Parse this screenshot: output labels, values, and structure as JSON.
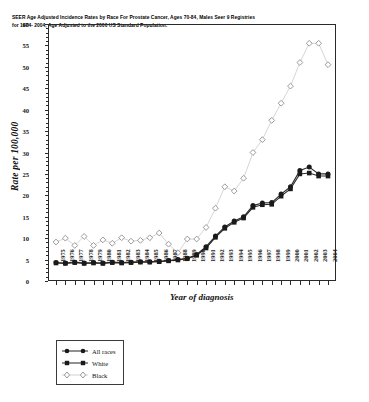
{
  "chart_data": {
    "type": "line",
    "title": "SEER  Age Adjusted Incidence Rates by Race For Prostate Cancer,  Ages 70-84, Males Seer 9 Registries for 1974- 2004, Age Adjusted to the 2000 US Standard Population.",
    "xlabel": "Year of diagnosis",
    "ylabel": "Rate per 100,000",
    "xlim": [
      1975,
      2004
    ],
    "ylim": [
      0,
      60
    ],
    "ytick_step": 5,
    "grid": false,
    "legend_position": "below-left",
    "x": [
      1975,
      1976,
      1977,
      1978,
      1979,
      1980,
      1981,
      1982,
      1983,
      1984,
      1985,
      1986,
      1987,
      1988,
      1989,
      1990,
      1991,
      1992,
      1993,
      1994,
      1995,
      1996,
      1997,
      1998,
      1999,
      2000,
      2001,
      2002,
      2003,
      2004
    ],
    "ytick_labels": [
      "0",
      "5",
      "10",
      "15",
      "20",
      "25",
      "30",
      "35",
      "40",
      "45",
      "50",
      "55",
      "60"
    ],
    "series": [
      {
        "name": "All races",
        "marker": "filled-circle",
        "color": "#1a1a1a",
        "values": [
          4.3,
          4.2,
          4.4,
          4.2,
          4.3,
          4.2,
          4.4,
          4.3,
          4.4,
          4.5,
          4.5,
          4.6,
          4.8,
          5.0,
          5.3,
          6.2,
          8.0,
          10.5,
          12.6,
          14.0,
          15.0,
          17.6,
          18.2,
          18.3,
          20.3,
          22.0,
          25.8,
          26.6,
          25.0,
          25.0
        ]
      },
      {
        "name": "White",
        "marker": "filled-square",
        "color": "#1a1a1a",
        "values": [
          4.2,
          4.1,
          4.3,
          4.1,
          4.2,
          4.1,
          4.3,
          4.2,
          4.3,
          4.4,
          4.4,
          4.5,
          4.7,
          4.9,
          5.2,
          6.0,
          7.7,
          10.2,
          12.3,
          13.7,
          14.7,
          17.2,
          17.8,
          17.9,
          19.8,
          21.5,
          25.0,
          25.2,
          24.5,
          24.5
        ]
      },
      {
        "name": "Black",
        "marker": "open-diamond",
        "color": "#bdbdbd",
        "values": [
          9.1,
          10.0,
          8.3,
          10.4,
          8.3,
          9.6,
          8.8,
          10.1,
          9.3,
          9.5,
          10.1,
          11.2,
          8.6,
          6.6,
          9.8,
          9.8,
          12.5,
          17.0,
          22.0,
          21.0,
          24.0,
          30.0,
          33.0,
          37.5,
          41.5,
          45.5,
          51.0,
          55.5,
          55.5,
          50.5
        ]
      }
    ]
  },
  "legend": {
    "items": [
      {
        "label": "All races",
        "marker": "filled-circle"
      },
      {
        "label": "White",
        "marker": "filled-square"
      },
      {
        "label": "Black",
        "marker": "open-diamond"
      }
    ]
  }
}
